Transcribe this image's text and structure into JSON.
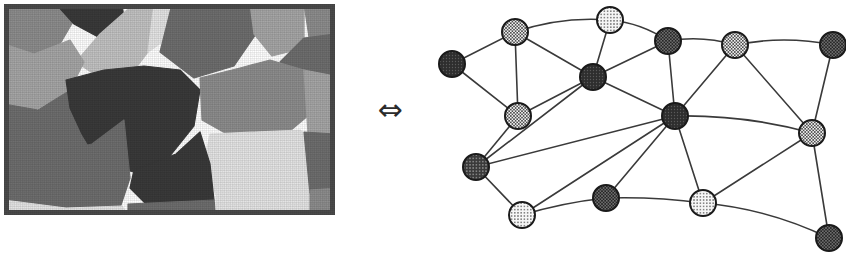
{
  "figure": {
    "background_color": "#ffffff",
    "width": 846,
    "height": 257
  },
  "relation_symbol": {
    "glyph": "⇔",
    "name": "left-right-double-arrow",
    "meaning": "equivalent-to",
    "color": "#2b2b2b"
  },
  "segmented_image": {
    "label": "segmented image",
    "frame": {
      "x": 4,
      "y": 4,
      "width": 331,
      "height": 211
    },
    "border_color": "#4a4a4a",
    "border_width": 5,
    "palette": {
      "very_dark": "#3a3a3a",
      "dark": "#6e6e6e",
      "mid": "#8d8d8d",
      "mid_light": "#a6a6a6",
      "light": "#c2c2c2",
      "very_light": "#e4e4e4"
    },
    "regions": [
      {
        "id": "r1",
        "tone": "mid",
        "color": "#8d8d8d",
        "points": "0,0 52,0 70,16 56,40 24,56 0,44"
      },
      {
        "id": "r2",
        "tone": "very_dark",
        "color": "#3a3a3a",
        "points": "52,0 118,0 120,14 96,34 70,20"
      },
      {
        "id": "r3",
        "tone": "light",
        "color": "#c2c2c2",
        "points": "96,30 130,0 168,0 150,40 126,72 96,74 72,58"
      },
      {
        "id": "r4",
        "tone": "very_light",
        "color": "#e4e4e4",
        "points": "150,0 176,0 164,34 144,48"
      },
      {
        "id": "r5",
        "tone": "dark",
        "color": "#6e6e6e",
        "points": "168,0 246,0 252,30 230,62 190,74 156,48"
      },
      {
        "id": "r6",
        "tone": "mid_light",
        "color": "#a6a6a6",
        "points": "246,0 300,0 300,44 268,52 250,30"
      },
      {
        "id": "r7",
        "tone": "mid",
        "color": "#8d8d8d",
        "points": "300,0 331,0 331,34 306,40"
      },
      {
        "id": "r8",
        "tone": "dark",
        "color": "#6e6e6e",
        "points": "300,34 331,30 331,76 300,78 276,58"
      },
      {
        "id": "r9",
        "tone": "mid_light",
        "color": "#a6a6a6",
        "points": "0,40 30,50 66,36 80,58 66,86 28,108 0,104"
      },
      {
        "id": "r10",
        "tone": "dark",
        "color": "#6e6e6e",
        "points": "0,100 34,106 70,84 96,74 126,76 118,112 88,140 40,152 0,146"
      },
      {
        "id": "r11",
        "tone": "very_dark",
        "color": "#3a3a3a",
        "points": "62,76 100,66 140,62 176,66 196,86 190,122 166,152 130,168 96,160 78,130 66,104"
      },
      {
        "id": "r12",
        "tone": "mid",
        "color": "#8d8d8d",
        "points": "196,74 236,64 266,56 300,66 306,110 280,132 230,134 198,116"
      },
      {
        "id": "r13",
        "tone": "mid_light",
        "color": "#a6a6a6",
        "points": "300,66 331,72 331,132 304,130"
      },
      {
        "id": "r14",
        "tone": "very_light",
        "color": "#e4e4e4",
        "points": "206,130 296,126 306,136 306,192 214,196 200,160"
      },
      {
        "id": "r15",
        "tone": "dark",
        "color": "#6e6e6e",
        "points": "300,128 331,130 331,186 306,190"
      },
      {
        "id": "r16",
        "tone": "very_dark",
        "color": "#3a3a3a",
        "points": "130,166 172,150 196,128 206,160 210,196 180,204 142,200 126,184"
      },
      {
        "id": "r17",
        "tone": "dark",
        "color": "#6e6e6e",
        "points": "0,144 44,150 88,140 120,116 126,174 116,204 60,206 0,202"
      },
      {
        "id": "r18",
        "tone": "very_light",
        "color": "#e4e4e4",
        "points": "0,196 62,204 118,202 124,211 0,211"
      },
      {
        "id": "r19",
        "tone": "dark",
        "color": "#6e6e6e",
        "points": "124,200 210,196 212,211 124,211"
      },
      {
        "id": "r20",
        "tone": "very_light",
        "color": "#e4e4e4",
        "points": "212,192 306,190 308,211 212,211"
      },
      {
        "id": "r21",
        "tone": "mid",
        "color": "#8d8d8d",
        "points": "306,186 331,184 331,211 306,211"
      }
    ]
  },
  "graph": {
    "label": "region adjacency graph",
    "node_radius": 13,
    "node_stroke_color": "#1a1a1a",
    "node_stroke_width": 2,
    "edge_color": "#3a3a3a",
    "edge_width": 1.6,
    "fill_styles": {
      "dark": "#3c3c3c",
      "medium": "#8a8a8a",
      "light": "#ededed"
    },
    "nodes": [
      {
        "id": "n1",
        "label": "n1",
        "x": 22,
        "y": 64,
        "fill": "dark",
        "pattern": "solid-dark"
      },
      {
        "id": "n2",
        "label": "n2",
        "x": 85,
        "y": 32,
        "fill": "medium",
        "pattern": "checker"
      },
      {
        "id": "n3",
        "label": "n3",
        "x": 88,
        "y": 116,
        "fill": "medium",
        "pattern": "checker"
      },
      {
        "id": "n4",
        "label": "n4",
        "x": 180,
        "y": 20,
        "fill": "light",
        "pattern": "dots"
      },
      {
        "id": "n5",
        "label": "n5",
        "x": 163,
        "y": 77,
        "fill": "dark",
        "pattern": "solid-dark"
      },
      {
        "id": "n6",
        "label": "n6",
        "x": 238,
        "y": 41,
        "fill": "dark",
        "pattern": "dark-checker"
      },
      {
        "id": "n7",
        "label": "n7",
        "x": 305,
        "y": 45,
        "fill": "medium",
        "pattern": "checker"
      },
      {
        "id": "n8",
        "label": "n8",
        "x": 403,
        "y": 45,
        "fill": "medium",
        "pattern": "dark-checker"
      },
      {
        "id": "n9",
        "label": "n9",
        "x": 245,
        "y": 116,
        "fill": "dark",
        "pattern": "solid-dark"
      },
      {
        "id": "n10",
        "label": "n10",
        "x": 382,
        "y": 133,
        "fill": "medium",
        "pattern": "checker"
      },
      {
        "id": "n11",
        "label": "n11",
        "x": 46,
        "y": 167,
        "fill": "dark",
        "pattern": "dark-dots"
      },
      {
        "id": "n12",
        "label": "n12",
        "x": 92,
        "y": 215,
        "fill": "light",
        "pattern": "dots"
      },
      {
        "id": "n13",
        "label": "n13",
        "x": 176,
        "y": 198,
        "fill": "medium",
        "pattern": "dark-checker"
      },
      {
        "id": "n14",
        "label": "n14",
        "x": 273,
        "y": 203,
        "fill": "light",
        "pattern": "dots"
      },
      {
        "id": "n15",
        "label": "n15",
        "x": 399,
        "y": 238,
        "fill": "medium",
        "pattern": "dark-checker"
      }
    ],
    "edges": [
      {
        "from": "n1",
        "to": "n2"
      },
      {
        "from": "n1",
        "to": "n3"
      },
      {
        "from": "n2",
        "to": "n3"
      },
      {
        "from": "n2",
        "to": "n4"
      },
      {
        "from": "n2",
        "to": "n5"
      },
      {
        "from": "n3",
        "to": "n11"
      },
      {
        "from": "n3",
        "to": "n5"
      },
      {
        "from": "n4",
        "to": "n5"
      },
      {
        "from": "n4",
        "to": "n6"
      },
      {
        "from": "n5",
        "to": "n6"
      },
      {
        "from": "n5",
        "to": "n9"
      },
      {
        "from": "n5",
        "to": "n11"
      },
      {
        "from": "n6",
        "to": "n7"
      },
      {
        "from": "n6",
        "to": "n9"
      },
      {
        "from": "n7",
        "to": "n8"
      },
      {
        "from": "n7",
        "to": "n9"
      },
      {
        "from": "n7",
        "to": "n10"
      },
      {
        "from": "n8",
        "to": "n10"
      },
      {
        "from": "n9",
        "to": "n10"
      },
      {
        "from": "n9",
        "to": "n11"
      },
      {
        "from": "n9",
        "to": "n13"
      },
      {
        "from": "n9",
        "to": "n14"
      },
      {
        "from": "n9",
        "to": "n12"
      },
      {
        "from": "n10",
        "to": "n14"
      },
      {
        "from": "n10",
        "to": "n15"
      },
      {
        "from": "n11",
        "to": "n12"
      },
      {
        "from": "n12",
        "to": "n13"
      },
      {
        "from": "n13",
        "to": "n14"
      },
      {
        "from": "n14",
        "to": "n15"
      }
    ],
    "curved_edges": [
      {
        "from": "n2",
        "to": "n4",
        "bow": -10
      },
      {
        "from": "n4",
        "to": "n6",
        "bow": -8
      },
      {
        "from": "n6",
        "to": "n7",
        "bow": -8
      },
      {
        "from": "n7",
        "to": "n8",
        "bow": -10
      },
      {
        "from": "n9",
        "to": "n10",
        "bow": -10
      },
      {
        "from": "n14",
        "to": "n15",
        "bow": -12
      },
      {
        "from": "n12",
        "to": "n13",
        "bow": -4
      },
      {
        "from": "n13",
        "to": "n14",
        "bow": -4
      }
    ]
  }
}
